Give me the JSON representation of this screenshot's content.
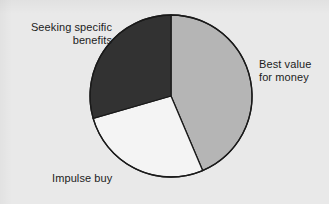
{
  "background_color": "#e9e9e9",
  "chart_data": {
    "type": "pie",
    "title": "",
    "subtitle": "",
    "xlabel": "",
    "ylabel": "",
    "legend_position": "none",
    "grid": false,
    "labels_position": "outside",
    "total": 100,
    "units": "percent",
    "center": {
      "x": 171,
      "y": 96
    },
    "radius": 81,
    "start_angle_deg": 0,
    "direction": "clockwise",
    "outline_color": "#1a1a1a",
    "outline_width": 1.3,
    "categories": [
      "Best value for money",
      "Impulse buy",
      "Seeking specific benefits"
    ],
    "values": [
      43.6,
      27.0,
      29.4
    ],
    "slices": [
      {
        "label": "Best value\nfor money",
        "label_plain": "Best value for money",
        "value": 43.6,
        "color": "#b5b5b5",
        "start_angle_deg": 0,
        "end_angle_deg": 157
      },
      {
        "label": "Impulse buy",
        "label_plain": "Impulse buy",
        "value": 27.0,
        "color": "#f4f4f4",
        "start_angle_deg": 157,
        "end_angle_deg": 254
      },
      {
        "label": "Seeking specific\nbenefits",
        "label_plain": "Seeking specific benefits",
        "value": 29.4,
        "color": "#323232",
        "start_angle_deg": 254,
        "end_angle_deg": 360
      }
    ]
  },
  "labels": {
    "seeking": "Seeking specific\nbenefits",
    "best_value": "Best value\nfor money",
    "impulse": "Impulse buy"
  }
}
